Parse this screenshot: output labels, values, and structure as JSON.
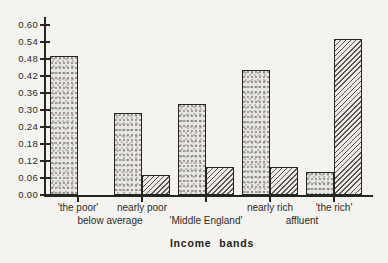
{
  "page": {
    "background": "#f4f3ef"
  },
  "chart_data": {
    "type": "bar",
    "title": "",
    "xlabel": "Income bands",
    "ylabel": "",
    "ylim": [
      0,
      0.6
    ],
    "ytick_step": 0.06,
    "ytick_labels": [
      "0.00",
      "0.06",
      "0.12",
      "0.18",
      "0.24",
      "0.30",
      "0.36",
      "0.42",
      "0.48",
      "0.54",
      "0.60"
    ],
    "grid": false,
    "legend_position": "none",
    "categories": [
      "'the poor'",
      "nearly poor",
      "'Middle England'",
      "nearly rich",
      "'the rich'"
    ],
    "x_axis_labels": [
      {
        "text": "'the poor'",
        "row": 1,
        "pos_units": 0.5
      },
      {
        "text": "below average",
        "row": 2,
        "pos_units": 1.0
      },
      {
        "text": "nearly poor",
        "row": 1,
        "pos_units": 1.5
      },
      {
        "text": "'Middle England'",
        "row": 2,
        "pos_units": 2.5
      },
      {
        "text": "nearly rich",
        "row": 1,
        "pos_units": 3.5
      },
      {
        "text": "affluent",
        "row": 2,
        "pos_units": 4.0
      },
      {
        "text": "'the rich'",
        "row": 1,
        "pos_units": 4.5
      }
    ],
    "series": [
      {
        "name": "stippled",
        "pattern": "stipple",
        "values": [
          0.49,
          0.29,
          0.32,
          0.44,
          0.08
        ]
      },
      {
        "name": "hatched",
        "pattern": "hatch",
        "values": [
          0.0,
          0.07,
          0.1,
          0.1,
          0.55
        ]
      }
    ],
    "colors": {
      "axis": "#26251f",
      "bar_outline": "#26251f",
      "stipple_fill": "#e8e6e1",
      "stipple_dots": "#77756d",
      "hatch_fill": "#edebe6",
      "hatch_lines": "#57554e",
      "background": "#f4f3ef"
    }
  }
}
